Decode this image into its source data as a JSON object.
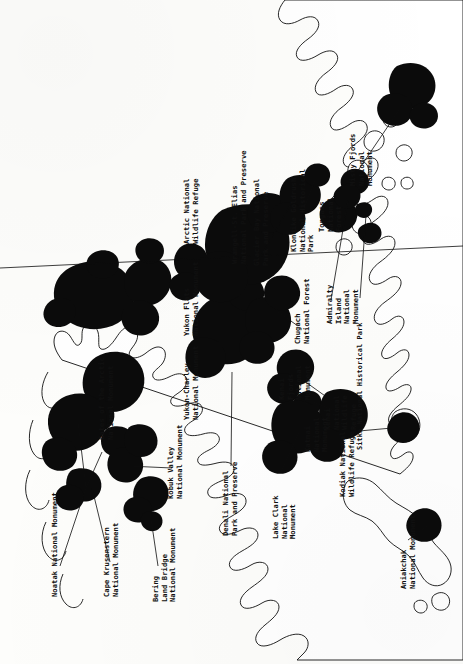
{
  "map": {
    "title": "Alaska National Parks, Monuments, Forests and Refuges",
    "orientation": "rotated-90-ccw-labels",
    "background_color": "#fdfdfb",
    "land_color": "#ffffff",
    "park_color": "#0b0b0b",
    "outline_color": "#101010",
    "labels": [
      {
        "id": "arctic-nwr",
        "text": "Arctic National\nWildlife Refuge",
        "x": 183,
        "y": 244
      },
      {
        "id": "yukon-flats",
        "text": "Yukon Flats\nNational Monument",
        "x": 183,
        "y": 244
      },
      {
        "id": "yukon-charley",
        "text": "Yukon-Charley\nNational Monument",
        "x": 183,
        "y": 244
      },
      {
        "id": "wrangell-st-elias",
        "text": "Wrangell-St. Elias\nNational Park and Preserve",
        "x": 231,
        "y": 264
      },
      {
        "id": "glacier-bay",
        "text": "Glacier Bay National\nPark and Preserve",
        "x": 253,
        "y": 264
      },
      {
        "id": "klondike-goldrush",
        "text": "Klondike Goldrush\nNational Historical\nPark",
        "x": 290,
        "y": 252
      },
      {
        "id": "tongass",
        "text": "Tongass\nNational\nForest",
        "x": 318,
        "y": 232
      },
      {
        "id": "misty-fjords",
        "text": "Misty Fjords\nNational\nMonument",
        "x": 349,
        "y": 186
      },
      {
        "id": "chugach",
        "text": "Chugach\nNational Forest",
        "x": 294,
        "y": 344
      },
      {
        "id": "admiralty-island",
        "text": "Admiralty\nIsland\nNational\nMonument",
        "x": 326,
        "y": 324
      },
      {
        "id": "kenai-nwr",
        "text": "Kenai\nNational\nWildlife\nRefuge",
        "x": 324,
        "y": 430
      },
      {
        "id": "sitka",
        "text": "Sitka National Historical Park",
        "x": 356,
        "y": 450
      },
      {
        "id": "kenai-fjords",
        "text": "Kenai\nFjords\nNational\nMonument",
        "x": 278,
        "y": 400
      },
      {
        "id": "katmai",
        "text": "Katmai\nNational\nMonument",
        "x": 304,
        "y": 452
      },
      {
        "id": "kodiak-nwr",
        "text": "Kodiak National\nWildlife Refuge",
        "x": 339,
        "y": 497
      },
      {
        "id": "lake-clark",
        "text": "Lake Clark\nNational\nMonument",
        "x": 272,
        "y": 539
      },
      {
        "id": "aniakchak",
        "text": "Aniakchak\nNational Monument",
        "x": 400,
        "y": 589
      },
      {
        "id": "denali",
        "text": "Denali National\nPark and Preserve",
        "x": 222,
        "y": 536
      },
      {
        "id": "gates-of-the-arctic",
        "text": "Gates of the Arctic\nNational Monument",
        "x": 98,
        "y": 440
      },
      {
        "id": "kobuk-valley",
        "text": "Kobuk Valley\nNational Monument",
        "x": 167,
        "y": 499
      },
      {
        "id": "noatak",
        "text": "Noatak National Monument",
        "x": 51,
        "y": 597
      },
      {
        "id": "cape-krusenstern",
        "text": "Cape Krusenstern\nNational Monument",
        "x": 103,
        "y": 597
      },
      {
        "id": "bering-land-bridge",
        "text": "Bering\nLand Bridge\nNational Monument",
        "x": 152,
        "y": 602
      }
    ],
    "park_areas": [
      "arctic-nwr",
      "yukon-flats",
      "yukon-charley",
      "wrangell-st-elias",
      "glacier-bay",
      "klondike-goldrush",
      "tongass",
      "misty-fjords",
      "chugach",
      "admiralty-island",
      "kenai-nwr",
      "sitka",
      "kenai-fjords",
      "katmai",
      "kodiak-nwr",
      "lake-clark",
      "aniakchak",
      "denali",
      "gates-of-the-arctic",
      "kobuk-valley",
      "noatak",
      "cape-krusenstern",
      "bering-land-bridge"
    ]
  }
}
